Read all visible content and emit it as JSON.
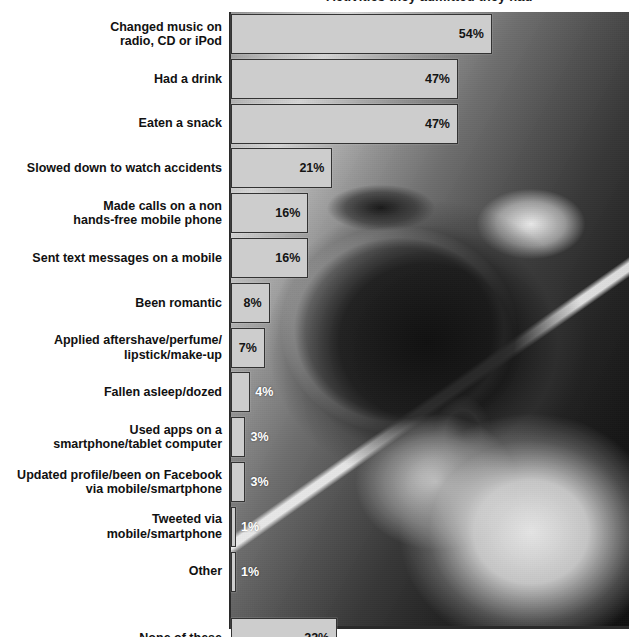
{
  "chart_data": {
    "type": "bar",
    "orientation": "horizontal",
    "title": "Activities they admitted they had",
    "xlabel": "",
    "ylabel": "",
    "xlim": [
      0,
      60
    ],
    "grid": false,
    "legend": null,
    "value_suffix": "%",
    "categories": [
      "Changed music on\nradio, CD or iPod",
      "Had a drink",
      "Eaten a snack",
      "Slowed down to watch accidents",
      "Made calls on a non\nhands-free mobile phone",
      "Sent text messages on a mobile",
      "Been romantic",
      "Applied aftershave/perfume/\nlipstick/make-up",
      "Fallen asleep/dozed",
      "Used apps on a\nsmartphone/tablet computer",
      "Updated profile/been on Facebook\nvia mobile/smartphone",
      "Tweeted via\nmobile/smartphone",
      "Other",
      "None of these"
    ],
    "values": [
      54,
      47,
      47,
      21,
      16,
      16,
      8,
      7,
      4,
      3,
      3,
      1,
      1,
      22
    ],
    "data_labels": [
      "54%",
      "47%",
      "47%",
      "21%",
      "16%",
      "16%",
      "8%",
      "7%",
      "4%",
      "3%",
      "3%",
      "1%",
      "1%",
      "22%"
    ],
    "label_placement": [
      "inside",
      "inside",
      "inside",
      "inside",
      "inside",
      "inside",
      "inside",
      "inside",
      "outside",
      "outside",
      "outside",
      "outside",
      "outside",
      "inside"
    ],
    "bar_fill": "#cdcdcd",
    "bar_stroke": "#333333",
    "axis_color": "#2a2a2a",
    "label_color": "#111111",
    "outside_label_color": "#ffffff",
    "background_image_description": "grayscale photo of a driver holding a cigarette, one hand on the steering wheel, mobile phone resting on the wheel"
  },
  "rows": [
    {
      "label": "Changed music on\nradio, CD or iPod",
      "value_text": "54%"
    },
    {
      "label": "Had a drink",
      "value_text": "47%"
    },
    {
      "label": "Eaten a snack",
      "value_text": "47%"
    },
    {
      "label": "Slowed down to watch accidents",
      "value_text": "21%"
    },
    {
      "label": "Made calls on a non\nhands-free mobile phone",
      "value_text": "16%"
    },
    {
      "label": "Sent text messages on a mobile",
      "value_text": "16%"
    },
    {
      "label": "Been romantic",
      "value_text": "8%"
    },
    {
      "label": "Applied aftershave/perfume/\nlipstick/make-up",
      "value_text": "7%"
    },
    {
      "label": "Fallen asleep/dozed",
      "value_text": "4%"
    },
    {
      "label": "Used apps on a\nsmartphone/tablet computer",
      "value_text": "3%"
    },
    {
      "label": "Updated profile/been on Facebook\nvia mobile/smartphone",
      "value_text": "3%"
    },
    {
      "label": "Tweeted via\nmobile/smartphone",
      "value_text": "1%"
    },
    {
      "label": "Other",
      "value_text": "1%"
    },
    {
      "label": "None of these",
      "value_text": "22%"
    }
  ]
}
